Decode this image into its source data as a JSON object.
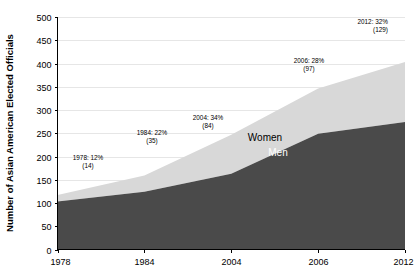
{
  "chart_data": {
    "type": "area",
    "stacked": true,
    "title": "",
    "subtitle": "",
    "xlabel": "",
    "ylabel": "Number of Asian American Elected Officials",
    "categories": [
      "1978",
      "1984",
      "2004",
      "2006",
      "2012"
    ],
    "x_tick_labels": [
      "1978",
      "1984",
      "2004",
      "2006",
      "2012"
    ],
    "y_tick_labels": [
      "0",
      "50",
      "100",
      "150",
      "200",
      "250",
      "300",
      "350",
      "400",
      "450",
      "500"
    ],
    "y_tick_values": [
      0,
      50,
      100,
      150,
      200,
      250,
      300,
      350,
      400,
      450,
      500
    ],
    "ylim": [
      0,
      500
    ],
    "y_step": 50,
    "grid": true,
    "grid_axis": "y",
    "legend": "inline-labels",
    "series": [
      {
        "name": "Men",
        "label": "Men",
        "color": "#4a4a4a",
        "label_color": "#ffffff",
        "values": [
          103,
          124,
          163,
          249,
          274
        ]
      },
      {
        "name": "Women",
        "label": "Women",
        "color": "#d8d8d8",
        "label_color": "#000000",
        "values": [
          14,
          35,
          84,
          97,
          129
        ]
      }
    ],
    "totals": [
      117,
      159,
      247,
      346,
      403
    ],
    "annotations": [
      {
        "id": "1978",
        "line1": "1978: 12%",
        "line2": "(14)",
        "year": "1978",
        "percent": "12%",
        "count": "14"
      },
      {
        "id": "1984",
        "line1": "1984: 22%",
        "line2": "(35)",
        "year": "1984",
        "percent": "22%",
        "count": "35"
      },
      {
        "id": "2004",
        "line1": "2004: 34%",
        "line2": "(84)",
        "year": "2004",
        "percent": "34%",
        "count": "84"
      },
      {
        "id": "2006",
        "line1": "2006: 28%",
        "line2": "(97)",
        "year": "2006",
        "percent": "28%",
        "count": "97"
      },
      {
        "id": "2012",
        "line1": "2012: 32%",
        "line2": "(129)",
        "year": "2012",
        "percent": "32%",
        "count": "129"
      }
    ],
    "colors": {
      "men": "#4a4a4a",
      "women": "#d8d8d8",
      "background": "#ffffff",
      "gridline": "#e6e6e6",
      "axis": "#000000"
    }
  }
}
